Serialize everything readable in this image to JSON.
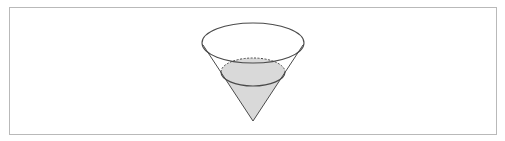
{
  "figure": {
    "colors": {
      "frame_border": "#b9b9b9",
      "outline": "#4a4a4a",
      "liquid_fill": "#d9d9d9"
    },
    "cone": {
      "apex": [
        253,
        121
      ],
      "rim_ellipse": {
        "cx": 253,
        "cy": 43,
        "rx": 51,
        "ry": 20
      }
    },
    "liquid": {
      "surface_ellipse": {
        "cx": 253,
        "cy": 72,
        "rx": 32,
        "ry": 14
      },
      "back_edge_style": "dashed"
    }
  }
}
